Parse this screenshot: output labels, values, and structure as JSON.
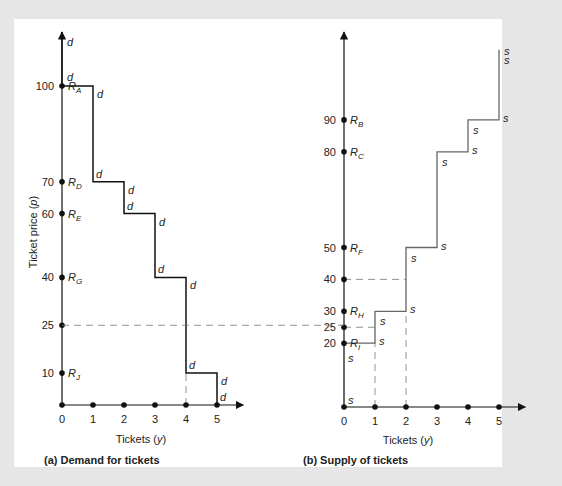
{
  "chart_data": [
    {
      "type": "line",
      "step": true,
      "title": "(a) Demand for tickets",
      "xlabel": "Tickets (y)",
      "ylabel": "Ticket price (p)",
      "x_ticks": [
        "0",
        "1",
        "2",
        "3",
        "4",
        "5"
      ],
      "y_ticks": [
        "100",
        "70",
        "60",
        "40",
        "25",
        "10"
      ],
      "reservation_prices": [
        {
          "label": "R",
          "sub": "A",
          "value": 100
        },
        {
          "label": "R",
          "sub": "D",
          "value": 70
        },
        {
          "label": "R",
          "sub": "E",
          "value": 60
        },
        {
          "label": "R",
          "sub": "G",
          "value": 40
        },
        {
          "label": "R",
          "sub": "J",
          "value": 10
        }
      ],
      "series": [
        {
          "name": "d",
          "points": [
            [
              0,
              110
            ],
            [
              0,
              100
            ],
            [
              1,
              100
            ],
            [
              1,
              70
            ],
            [
              2,
              70
            ],
            [
              2,
              60
            ],
            [
              3,
              60
            ],
            [
              3,
              40
            ],
            [
              4,
              40
            ],
            [
              4,
              10
            ],
            [
              5,
              10
            ],
            [
              5,
              0
            ]
          ]
        }
      ],
      "annotations": [
        {
          "type": "dashed-hline",
          "y": 25,
          "label": "25",
          "extends_to_panel_b": true
        },
        {
          "type": "dashed-vline",
          "x": 4,
          "y_from": 0,
          "y_to": 10
        }
      ],
      "curve_label": "d",
      "xlim": [
        0,
        5.8
      ],
      "ylim": [
        0,
        115
      ]
    },
    {
      "type": "line",
      "step": true,
      "title": "(b) Supply of tickets",
      "xlabel": "Tickets (y)",
      "ylabel": "",
      "x_ticks": [
        "0",
        "1",
        "2",
        "3",
        "4",
        "5"
      ],
      "y_ticks": [
        "90",
        "80",
        "50",
        "40",
        "30",
        "25",
        "20"
      ],
      "reservation_prices": [
        {
          "label": "R",
          "sub": "B",
          "value": 90
        },
        {
          "label": "R",
          "sub": "C",
          "value": 80
        },
        {
          "label": "R",
          "sub": "F",
          "value": 50
        },
        {
          "label": "R",
          "sub": "H",
          "value": 30
        },
        {
          "label": "R",
          "sub": "I",
          "value": 20
        }
      ],
      "series": [
        {
          "name": "s",
          "points": [
            [
              0,
              0
            ],
            [
              0,
              20
            ],
            [
              1,
              20
            ],
            [
              1,
              30
            ],
            [
              2,
              30
            ],
            [
              2,
              50
            ],
            [
              3,
              50
            ],
            [
              3,
              80
            ],
            [
              4,
              80
            ],
            [
              4,
              90
            ],
            [
              5,
              90
            ],
            [
              5,
              112
            ]
          ]
        }
      ],
      "annotations": [
        {
          "type": "dashed-hline",
          "y": 40,
          "x_to": 2
        },
        {
          "type": "dashed-hline",
          "y": 25,
          "x_to": 1
        },
        {
          "type": "dashed-vline",
          "x": 1,
          "y_from": 0,
          "y_to": 20
        },
        {
          "type": "dashed-vline",
          "x": 2,
          "y_from": 0,
          "y_to": 30
        }
      ],
      "curve_label": "s",
      "xlim": [
        0,
        5.8
      ],
      "ylim": [
        0,
        115
      ]
    }
  ],
  "panel_a": {
    "caption": "(a) Demand for tickets",
    "xlabel": "Tickets (y)",
    "ylabel": "Ticket price (p)",
    "curve_label": "d"
  },
  "panel_b": {
    "caption": "(b) Supply of tickets",
    "xlabel": "Tickets (y)",
    "curve_label": "s"
  }
}
